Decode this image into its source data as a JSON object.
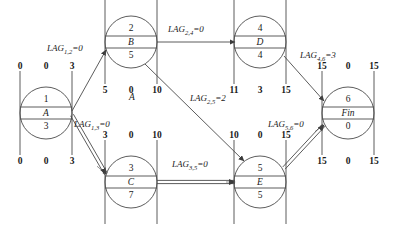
{
  "diagram": {
    "title_label": "A",
    "nodes": [
      {
        "key": "n1",
        "id": "1",
        "name": "A",
        "duration": "3",
        "cx": 46,
        "cy": 113,
        "r": 26,
        "top": {
          "left": "0",
          "mid": "0",
          "right": "3"
        },
        "bottom": {
          "left": "0",
          "mid": "0",
          "right": "3"
        }
      },
      {
        "key": "n2",
        "id": "2",
        "name": "B",
        "duration": "5",
        "cx": 131,
        "cy": 42,
        "r": 26,
        "top": {
          "left": "3",
          "mid": "2",
          "right": "8"
        },
        "bottom": {
          "left": "5",
          "mid": "0",
          "right": "10"
        }
      },
      {
        "key": "n3",
        "id": "3",
        "name": "C",
        "duration": "7",
        "cx": 131,
        "cy": 182,
        "r": 26,
        "top": {
          "left": "3",
          "mid": "0",
          "right": "10"
        },
        "bottom": {
          "left": "3",
          "mid": "0",
          "right": "10"
        }
      },
      {
        "key": "n4",
        "id": "4",
        "name": "D",
        "duration": "4",
        "cx": 260,
        "cy": 42,
        "r": 26,
        "top": {
          "left": "8",
          "mid": "3",
          "right": "12"
        },
        "bottom": {
          "left": "11",
          "mid": "3",
          "right": "15"
        }
      },
      {
        "key": "n5",
        "id": "5",
        "name": "E",
        "duration": "5",
        "cx": 260,
        "cy": 182,
        "r": 26,
        "top": {
          "left": "10",
          "mid": "0",
          "right": "15"
        },
        "bottom": {
          "left": "10",
          "mid": "0",
          "right": "15"
        }
      },
      {
        "key": "n6",
        "id": "6",
        "name": "Fin",
        "duration": "0",
        "cx": 348,
        "cy": 113,
        "r": 26,
        "top": {
          "left": "15",
          "mid": "0",
          "right": "15"
        },
        "bottom": {
          "left": "15",
          "mid": "0",
          "right": "15"
        }
      }
    ],
    "edges": [
      {
        "key": "e12",
        "from": "1",
        "to": "2",
        "lag": "0",
        "label": "LAG",
        "sub": "1,2",
        "critical": false
      },
      {
        "key": "e13",
        "from": "1",
        "to": "3",
        "lag": "0",
        "label": "LAG",
        "sub": "1,3",
        "critical": true
      },
      {
        "key": "e24",
        "from": "2",
        "to": "4",
        "lag": "0",
        "label": "LAG",
        "sub": "2,4",
        "critical": false
      },
      {
        "key": "e25",
        "from": "2",
        "to": "5",
        "lag": "2",
        "label": "LAG",
        "sub": "2,5",
        "critical": false
      },
      {
        "key": "e35",
        "from": "3",
        "to": "5",
        "lag": "0",
        "label": "LAG",
        "sub": "3,5",
        "critical": true
      },
      {
        "key": "e46",
        "from": "4",
        "to": "6",
        "lag": "3",
        "label": "LAG",
        "sub": "4,6",
        "critical": false
      },
      {
        "key": "e56",
        "from": "5",
        "to": "6",
        "lag": "0",
        "label": "LAG",
        "sub": "5,6",
        "critical": true
      }
    ],
    "lag_texts": [
      {
        "key": "l12",
        "text": "LAG",
        "sub": "1,2",
        "eq": "=0",
        "x": 47,
        "y": 43
      },
      {
        "key": "l13",
        "text": "LAG",
        "sub": "1,3",
        "eq": "=0",
        "x": 74,
        "y": 119
      },
      {
        "key": "l24",
        "text": "LAG",
        "sub": "2,4",
        "eq": "=0",
        "x": 168,
        "y": 24
      },
      {
        "key": "l25",
        "text": "LAG",
        "sub": "2,5",
        "eq": "=2",
        "x": 190,
        "y": 93
      },
      {
        "key": "l35",
        "text": "LAG",
        "sub": "3,5",
        "eq": "=0",
        "x": 172,
        "y": 159
      },
      {
        "key": "l46",
        "text": "LAG",
        "sub": "4,6",
        "eq": "=3",
        "x": 300,
        "y": 50
      },
      {
        "key": "l56",
        "text": "LAG",
        "sub": "5,6",
        "eq": "=0",
        "x": 268,
        "y": 119
      }
    ],
    "colors": {
      "line": "#4a4a4a",
      "text": "#1a1a1a",
      "background": "#ffffff"
    }
  }
}
